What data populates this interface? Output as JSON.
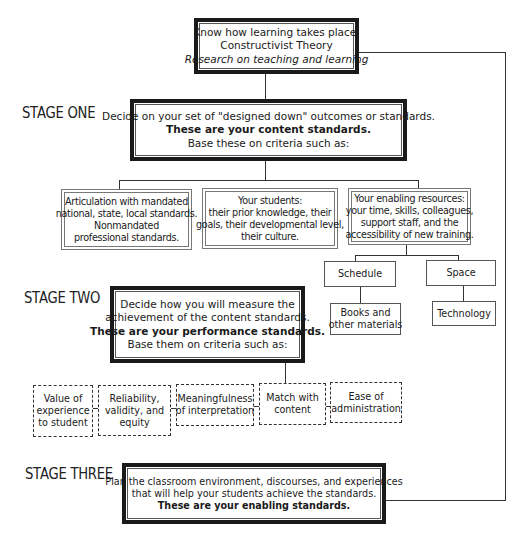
{
  "stages": {
    "one": "STAGE ONE",
    "two": "STAGE TWO",
    "three": "STAGE THREE"
  },
  "top_box": {
    "line1": "Know how learning takes place.",
    "line2": "Constructivist Theory",
    "line3": "Research on teaching and learning"
  },
  "stage_one_box": {
    "line1": "Decide on your set of \"designed down\" outcomes or standards.",
    "line2": "These are your content standards.",
    "line3": "Base these on criteria such as:"
  },
  "criteria_one": [
    {
      "lines": [
        "Articulation with mandated",
        "national, state, local standards.",
        "Nonmandated",
        "professional standards."
      ]
    },
    {
      "lines": [
        "Your students:",
        "their prior knowledge, their",
        "goals, their developmental level,",
        "their culture."
      ]
    },
    {
      "lines": [
        "Your enabling resources:",
        "your time, skills, colleagues,",
        "support staff, and the",
        "accessibility of new training."
      ]
    }
  ],
  "resources": {
    "schedule": "Schedule",
    "space": "Space",
    "books": [
      "Books and",
      "other materials"
    ],
    "technology": "Technology"
  },
  "stage_two_box": {
    "line1": "Decide how you will measure the",
    "line2": "achievement of the content standards.",
    "line3": "These are your performance standards.",
    "line4": "Base them on criteria such as:"
  },
  "criteria_two": [
    {
      "lines": [
        "Value of",
        "experience",
        "to student"
      ]
    },
    {
      "lines": [
        "Reliability,",
        "validity, and",
        "equity"
      ]
    },
    {
      "lines": [
        "Meaningfulness",
        "of interpretation"
      ]
    },
    {
      "lines": [
        "Match with",
        "content"
      ]
    },
    {
      "lines": [
        "Ease of",
        "administration"
      ]
    }
  ],
  "stage_three_box": {
    "line1": "Plan the classroom environment, discourses, and experiences",
    "line2": "that will help your students achieve the standards.",
    "line3": "These are your enabling standards."
  }
}
